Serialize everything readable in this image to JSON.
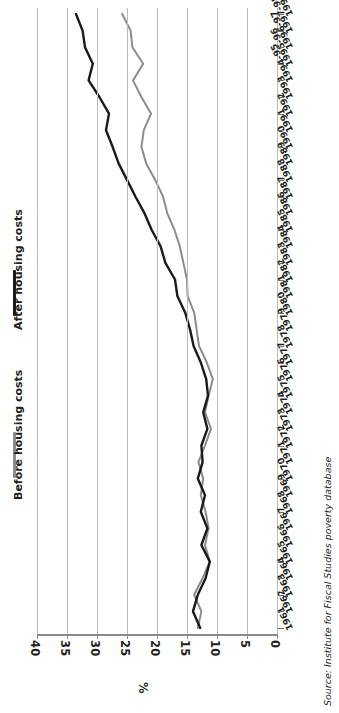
{
  "chart_data": {
    "type": "line",
    "title": "",
    "subtitle": "",
    "orientation": "rotated-90",
    "xlabel": "",
    "ylabel": "%",
    "ylim": [
      0,
      40
    ],
    "yticks": [
      0,
      5,
      10,
      15,
      20,
      25,
      30,
      35,
      40
    ],
    "ytick_labels": [
      "0",
      "5",
      "10",
      "15",
      "20",
      "25",
      "30",
      "35",
      "40"
    ],
    "grid": true,
    "legend_position": "left",
    "categories": [
      "1961",
      "1962",
      "1963",
      "1964",
      "1965",
      "1966",
      "1967",
      "1968",
      "1969",
      "1970",
      "1971",
      "1972",
      "1973",
      "1974",
      "1975",
      "1976",
      "1977",
      "1978",
      "1979",
      "1980",
      "1981",
      "1982",
      "1983",
      "1984",
      "1985",
      "1986",
      "1987",
      "1988",
      "1989",
      "1990",
      "1991",
      "1992",
      "1993",
      "1994-95",
      "1995-96",
      "1996-97",
      "1997-98",
      "1998-99"
    ],
    "series": [
      {
        "name": "Before housing costs",
        "color": "#8c8c8c",
        "values": [
          13.2,
          12.6,
          13.8,
          12.4,
          11.2,
          12.0,
          11.4,
          11.9,
          12.7,
          12.3,
          13.1,
          12.0,
          11.0,
          12.0,
          11.4,
          10.7,
          11.7,
          13.0,
          13.4,
          13.8,
          14.9,
          15.0,
          15.6,
          16.2,
          17.1,
          18.3,
          19.0,
          20.3,
          21.8,
          22.6,
          22.2,
          21.0,
          22.6,
          24.0,
          22.3,
          24.1,
          24.4,
          25.8
        ]
      },
      {
        "name": "After housing costs",
        "color": "#1a1a1a",
        "values": [
          12.8,
          14.0,
          13.2,
          11.9,
          11.2,
          12.6,
          11.6,
          12.7,
          12.0,
          13.2,
          12.4,
          12.6,
          11.6,
          12.3,
          11.5,
          11.8,
          12.7,
          13.9,
          14.5,
          15.3,
          16.6,
          17.0,
          18.6,
          19.4,
          20.9,
          22.1,
          23.6,
          25.0,
          26.4,
          27.4,
          28.5,
          28.0,
          29.6,
          31.4,
          30.7,
          32.0,
          32.4,
          33.5
        ]
      }
    ],
    "source": "Source: Institute for Fiscal Studies poverty database"
  },
  "legend": {
    "items": [
      {
        "label": "After housing costs",
        "color": "#1a1a1a"
      },
      {
        "label": "Before housing costs",
        "color": "#8c8c8c"
      }
    ]
  },
  "axis": {
    "value_label": "%"
  },
  "source_note": "Source: Institute for Fiscal Studies poverty database"
}
